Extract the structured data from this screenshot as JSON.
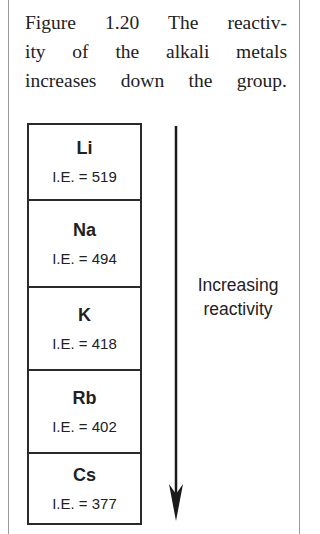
{
  "caption": {
    "lines": [
      "Figure 1.20   The reactiv-",
      "ity of the alkali metals",
      "increases down the group."
    ],
    "figure_number": "Figure 1.20",
    "text": "The reactivity of the alkali metals increases down the group."
  },
  "elements": [
    {
      "symbol": "Li",
      "ie": "I.E. = 519"
    },
    {
      "symbol": "Na",
      "ie": "I.E. = 494"
    },
    {
      "symbol": "K",
      "ie": "I.E. = 418"
    },
    {
      "symbol": "Rb",
      "ie": "I.E. = 402"
    },
    {
      "symbol": "Cs",
      "ie": "I.E. = 377"
    }
  ],
  "arrow_label": {
    "line1": "Increasing",
    "line2": "reactivity"
  }
}
